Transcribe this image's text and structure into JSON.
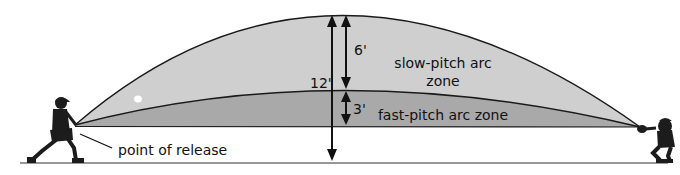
{
  "diagram": {
    "labels": {
      "slow_zone_line1": "slow-pitch arc",
      "slow_zone_line2": "zone",
      "fast_zone": "fast-pitch arc zone",
      "release": "point of release",
      "height_total": "12'",
      "height_slow": "6'",
      "height_fast": "3'"
    },
    "figures": {
      "pitcher": "pitcher-figure",
      "catcher": "catcher-figure",
      "ball": "ball"
    },
    "colors": {
      "slow_zone_fill": "#cfcfcf",
      "fast_zone_fill": "#a9a9a9",
      "outline": "#1a1a1a",
      "ground": "#333333",
      "figure": "#1c1c1c",
      "ball": "#ffffff"
    }
  }
}
